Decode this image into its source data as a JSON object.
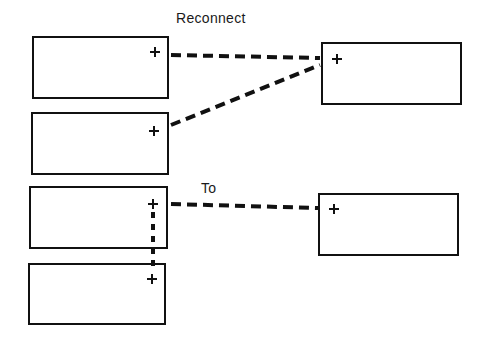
{
  "labels": {
    "reconnect": "Reconnect",
    "to": "To"
  },
  "colors": {
    "stroke": "#111111",
    "background": "#ffffff"
  },
  "boxes": [
    {
      "id": "left-1",
      "x": 33,
      "y": 37,
      "w": 135,
      "h": 61,
      "plus": {
        "x": 155,
        "y": 52
      }
    },
    {
      "id": "left-2",
      "x": 32,
      "y": 113,
      "w": 136,
      "h": 61,
      "plus": {
        "x": 154,
        "y": 131
      }
    },
    {
      "id": "left-3",
      "x": 30,
      "y": 187,
      "w": 137,
      "h": 61,
      "plus": {
        "x": 153,
        "y": 204
      }
    },
    {
      "id": "left-4",
      "x": 29,
      "y": 264,
      "w": 136,
      "h": 60,
      "plus": {
        "x": 152,
        "y": 279
      }
    },
    {
      "id": "right-1",
      "x": 322,
      "y": 43,
      "w": 139,
      "h": 61,
      "plus": {
        "x": 337,
        "y": 59
      }
    },
    {
      "id": "right-2",
      "x": 319,
      "y": 194,
      "w": 139,
      "h": 61,
      "plus": {
        "x": 334,
        "y": 209
      }
    }
  ],
  "connections": [
    {
      "from": "left-1",
      "to": "right-1",
      "style": "dashed",
      "x1": 171,
      "y1": 55,
      "x2": 320,
      "y2": 58
    },
    {
      "from": "left-2",
      "to": "right-1",
      "style": "dashed",
      "x1": 171,
      "y1": 125,
      "x2": 320,
      "y2": 65
    },
    {
      "from": "left-3",
      "to": "right-2",
      "style": "dashed",
      "x1": 171,
      "y1": 204,
      "x2": 318,
      "y2": 208
    },
    {
      "from": "left-3",
      "to": "left-4",
      "style": "dotted",
      "x1": 153,
      "y1": 211,
      "x2": 153,
      "y2": 266
    }
  ]
}
